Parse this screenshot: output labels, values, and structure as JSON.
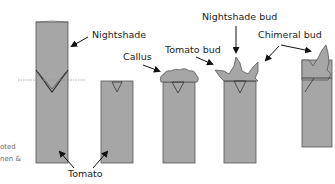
{
  "diagram": {
    "type": "grafting-process-illustration",
    "colors": {
      "stem_fill": "#a6a6a6",
      "stem_stroke": "#555555",
      "label_text": "#222222",
      "arrow": "#111111",
      "graft_line": "#9a9a9a",
      "side_text": "#6a6a6a"
    },
    "labels": {
      "nightshade": "Nightshade",
      "callus": "Callus",
      "tomato_bud": "Tomato bud",
      "nightshade_bud": "Nightshade bud",
      "chimeral_bud": "Chimeral bud",
      "tomato": "Tomato"
    },
    "side_text": {
      "line1": "oted",
      "line2": "nen &"
    },
    "stages": [
      {
        "id": "graft",
        "description": "Nightshade scion grafted onto tomato stock with V-cut"
      },
      {
        "id": "cut",
        "description": "Tomato stock cut back"
      },
      {
        "id": "callus",
        "description": "Callus forms at cut surface"
      },
      {
        "id": "buds",
        "description": "Tomato and nightshade buds emerge"
      },
      {
        "id": "chimera",
        "description": "Chimeral bud develops"
      }
    ]
  }
}
